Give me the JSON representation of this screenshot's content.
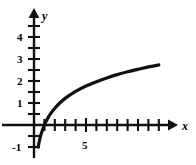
{
  "figure": {
    "name": "logarithmic-curve-graph",
    "background_color": "#ffffff",
    "ink_color": "#111111"
  },
  "axes": {
    "x_axis_label": "x",
    "y_axis_label": "y",
    "x_axis_name": "x-axis",
    "y_axis_name": "y-axis",
    "x_tick_labels": [
      "5"
    ],
    "y_tick_labels": [
      "4",
      "3",
      "2",
      "1",
      "-1"
    ]
  },
  "chart_data": {
    "type": "line",
    "title": "",
    "xlabel": "x",
    "ylabel": "y",
    "xlim": [
      -0.6,
      13.8
    ],
    "ylim": [
      -1.35,
      4.7
    ],
    "grid": false,
    "legend": null,
    "x_ticks": [
      1,
      2,
      3,
      4,
      5,
      6,
      7,
      8,
      9,
      10,
      11,
      12
    ],
    "x_tick_labels_shown": {
      "5": "5"
    },
    "y_ticks": [
      -1,
      -0.5,
      0.5,
      1,
      1.5,
      2,
      2.5,
      3,
      3.5,
      4,
      4.5
    ],
    "y_tick_labels_shown": {
      "4": "4",
      "3": "3",
      "2": "2",
      "1": "1",
      "-1": "-1"
    },
    "series": [
      {
        "name": "y = log curve",
        "equation": "y ≈ 1.1 · ln(x)",
        "x": [
          0.4,
          0.45,
          0.5,
          0.55,
          0.6,
          0.7,
          0.8,
          0.9,
          1.0,
          1.2,
          1.5,
          2.0,
          2.5,
          3.0,
          3.5,
          4.0,
          5.0,
          6.0,
          7.0,
          8.0,
          9.0,
          10.0,
          11.0,
          12.0
        ],
        "y": [
          -1.01,
          -0.88,
          -0.76,
          -0.66,
          -0.56,
          -0.39,
          -0.25,
          -0.12,
          0.0,
          0.2,
          0.45,
          0.76,
          1.01,
          1.21,
          1.38,
          1.53,
          1.77,
          1.97,
          2.14,
          2.29,
          2.42,
          2.53,
          2.64,
          2.73
        ]
      }
    ],
    "annotations": [
      {
        "text": "5",
        "x": 5,
        "y": -0.55,
        "name": "x-tick-label-5"
      },
      {
        "text": "4",
        "x": -0.55,
        "y": 4.0,
        "name": "y-tick-label-4"
      },
      {
        "text": "3",
        "x": -0.55,
        "y": 3.0,
        "name": "y-tick-label-3"
      },
      {
        "text": "2",
        "x": -0.55,
        "y": 2.0,
        "name": "y-tick-label-2"
      },
      {
        "text": "1",
        "x": -0.55,
        "y": 1.0,
        "name": "y-tick-label-1"
      },
      {
        "text": "-1",
        "x": -0.95,
        "y": -1.0,
        "name": "y-tick-label-neg1"
      }
    ]
  }
}
